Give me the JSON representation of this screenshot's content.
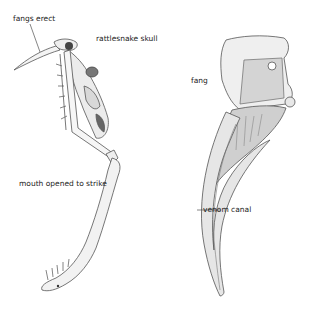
{
  "diagram": {
    "labels": {
      "fangs_erect": "fangs erect",
      "rattlesnake_skull": "rattlesnake skull",
      "fang": "fang",
      "mouth_opened": "mouth opened to strike",
      "venom_canal": "venom canal"
    },
    "colors": {
      "line": "#555555",
      "shade": "#9a9a9a",
      "dark": "#333333",
      "background": "#ffffff"
    }
  }
}
